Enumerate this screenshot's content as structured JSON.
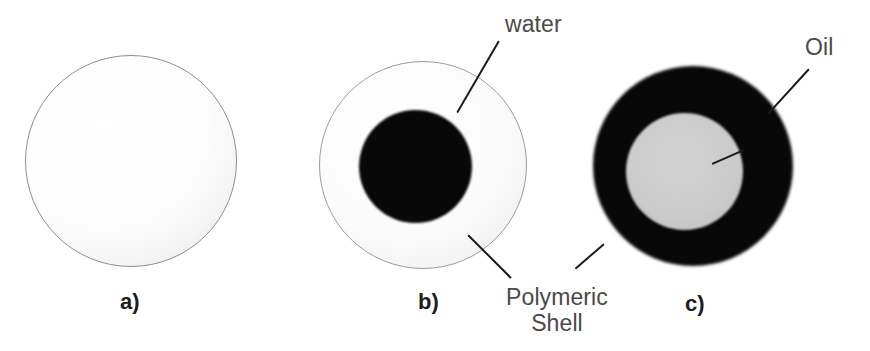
{
  "figure": {
    "background_color": "#ffffff",
    "width": 870,
    "height": 351
  },
  "palette": {
    "black_fill": "#080808",
    "gray_core": "#c8c8c8",
    "light_shell": "#f6f6f6",
    "outline": "#9b9b9b",
    "label_text": "#4a4a4a",
    "panel_letter_text": "#1d1d1d",
    "leader_line": "#1b1b1b"
  },
  "panels": [
    {
      "id": "a",
      "letter": "a)",
      "letter_x": 120,
      "letter_y": 291,
      "shapes": [
        {
          "name": "outer-sphere",
          "kind": "sphere-a",
          "cx": 131,
          "cy": 161,
          "d": 212
        }
      ]
    },
    {
      "id": "b",
      "letter": "b)",
      "letter_x": 418,
      "letter_y": 291,
      "shapes": [
        {
          "name": "polymeric-shell",
          "kind": "shell-b",
          "cx": 423,
          "cy": 165,
          "d": 208
        },
        {
          "name": "water-core",
          "kind": "core-b",
          "cx": 415,
          "cy": 166,
          "d": 113
        }
      ]
    },
    {
      "id": "c",
      "letter": "c)",
      "letter_x": 685,
      "letter_y": 293,
      "shapes": [
        {
          "name": "oil-shell",
          "kind": "shell-c",
          "cx": 693,
          "cy": 166,
          "d": 200
        },
        {
          "name": "polymeric-core",
          "kind": "core-c",
          "cx": 684,
          "cy": 171,
          "d": 117
        }
      ]
    }
  ],
  "annotations": [
    {
      "id": "water",
      "text": "water",
      "text_x": 505,
      "text_y": 11,
      "align": "left",
      "target": "water-core",
      "leaders": [
        {
          "x1": 499,
          "y1": 40,
          "x2": 457,
          "y2": 112
        }
      ]
    },
    {
      "id": "polymeric-shell",
      "text": "Polymeric\nShell",
      "text_x": 498,
      "text_y": 284,
      "align": "center",
      "width": 118,
      "target": "polymeric-shell",
      "leaders": [
        {
          "x1": 468,
          "y1": 234,
          "x2": 511,
          "y2": 277
        }
      ]
    },
    {
      "id": "oil",
      "text": "Oil",
      "text_x": 805,
      "text_y": 34,
      "align": "left",
      "target": "oil-shell",
      "leaders": [
        {
          "x1": 809,
          "y1": 68,
          "x2": 768,
          "y2": 113
        },
        {
          "x1": 744,
          "y1": 149,
          "x2": 712,
          "y2": 163
        }
      ]
    },
    {
      "id": "polymeric-shell-c",
      "text": "",
      "target": "oil-shell",
      "leaders": [
        {
          "x1": 604,
          "y1": 243,
          "x2": 575,
          "y2": 268
        }
      ]
    }
  ]
}
